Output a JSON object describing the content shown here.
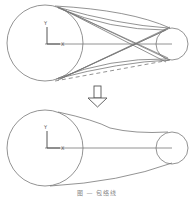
{
  "diagram": {
    "top_panel": {
      "axis_labels": {
        "y": "Y",
        "x": "X"
      },
      "large_circle": {
        "cx": 45,
        "cy": 43,
        "r": 38
      },
      "small_circle": {
        "cx": 172,
        "cy": 44,
        "r": 16
      },
      "description": "Candidate tangent lines and curves between two circles"
    },
    "arrow": {
      "direction": "down"
    },
    "bottom_panel": {
      "axis_labels": {
        "y": "Y",
        "x": "X"
      },
      "large_circle": {
        "cx": 45,
        "cy": 148,
        "r": 38
      },
      "small_circle": {
        "cx": 172,
        "cy": 148,
        "r": 16
      },
      "description": "Resulting enclosing belt shape"
    },
    "caption": "图 — 包络线"
  },
  "colors": {
    "line": "#777777",
    "arrow": "#555555",
    "background": "#ffffff"
  }
}
